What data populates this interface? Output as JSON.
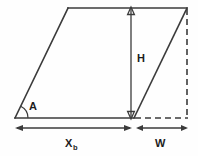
{
  "figure": {
    "background_color": "#fefefe",
    "line_color": "#3b3b3b",
    "label_color": "#1c1c1c",
    "labels": {
      "angle": "A",
      "height": "H",
      "base": "X",
      "base_subscript": "b",
      "width": "W"
    },
    "icons": {
      "angle_arc": "angle-arc-icon",
      "height_arrow": "vertical-double-arrow-icon",
      "base_arrow": "horizontal-double-arrow-icon",
      "width_arrow": "horizontal-double-arrow-icon"
    },
    "geometry": {
      "parallelogram_points": "15,118 68,8 187,8 134,118",
      "top_edge": {
        "x1": 68,
        "y1": 8,
        "x2": 187,
        "y2": 8
      },
      "left_edge": {
        "x1": 15,
        "y1": 118,
        "x2": 68,
        "y2": 8
      },
      "bottom_edge": {
        "x1": 15,
        "y1": 118,
        "x2": 134,
        "y2": 118
      },
      "right_edge": {
        "x1": 134,
        "y1": 118,
        "x2": 187,
        "y2": 8
      },
      "dashed_vertical": {
        "x1": 187,
        "y1": 8,
        "x2": 187,
        "y2": 118
      },
      "dashed_horizontal": {
        "x1": 134,
        "y1": 118,
        "x2": 187,
        "y2": 118
      },
      "height_arrow": {
        "x": 131,
        "y_top": 8,
        "y_bottom": 118
      },
      "base_dimension": {
        "y": 128,
        "x_left": 16,
        "x_right": 131
      },
      "width_dimension": {
        "y": 128,
        "x_left": 136,
        "x_right": 187
      },
      "angle_arc": {
        "cx": 15,
        "cy": 118,
        "radius": 13
      }
    },
    "label_positions": {
      "angle": {
        "x": 29,
        "y": 110
      },
      "height": {
        "x": 137,
        "y": 62
      },
      "base": {
        "x": 66,
        "y": 147
      },
      "base_subscript": {
        "x": 74,
        "y": 150
      },
      "width": {
        "x": 156,
        "y": 147
      }
    }
  }
}
